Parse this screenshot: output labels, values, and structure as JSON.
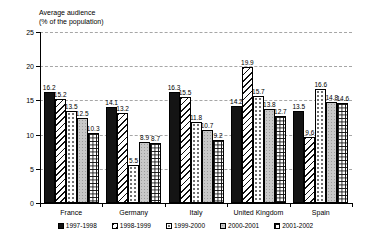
{
  "title": {
    "line1": "Average audience",
    "line2": "(% of the population)"
  },
  "chart_data": {
    "type": "bar",
    "title": "Average audience (% of the population)",
    "xlabel": "",
    "ylabel": "Average audience (% of the population)",
    "categories": [
      "France",
      "Germany",
      "Italy",
      "United Kingdom",
      "Spain"
    ],
    "series": [
      {
        "name": "1997-1998",
        "pattern": "solid-black",
        "values": [
          16.2,
          14.1,
          16.3,
          14.2,
          13.5
        ]
      },
      {
        "name": "1998-1999",
        "pattern": "diag",
        "values": [
          15.2,
          13.2,
          15.5,
          19.9,
          9.6
        ]
      },
      {
        "name": "1999-2000",
        "pattern": "dots",
        "values": [
          13.5,
          5.5,
          11.8,
          15.7,
          16.6
        ]
      },
      {
        "name": "2000-2001",
        "pattern": "gray",
        "values": [
          12.5,
          8.9,
          10.7,
          13.8,
          14.8
        ]
      },
      {
        "name": "2001-2002",
        "pattern": "grid",
        "values": [
          10.3,
          8.7,
          9.2,
          12.7,
          14.6
        ]
      }
    ],
    "ylim": [
      0,
      25
    ],
    "yticks": [
      0,
      5,
      10,
      15,
      20,
      25
    ],
    "grid": "horizontal-dashed",
    "legend_position": "bottom",
    "value_labels": true
  },
  "colors": {
    "background": "#ffffff",
    "text": "#000000",
    "axis": "#000000",
    "gridline": "#a6a6a6",
    "bar_dark": "#141414",
    "bar_gray": "#c8c8c8"
  }
}
